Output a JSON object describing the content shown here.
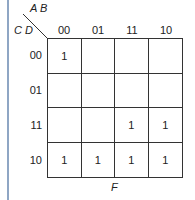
{
  "kmap": {
    "row_var": "C D",
    "col_var": "A B",
    "col_labels": [
      "00",
      "01",
      "11",
      "10"
    ],
    "row_labels": [
      "00",
      "01",
      "11",
      "10"
    ],
    "cells": [
      [
        "1",
        "",
        "",
        ""
      ],
      [
        "",
        "",
        "",
        ""
      ],
      [
        "",
        "",
        "1",
        "1"
      ],
      [
        "1",
        "1",
        "1",
        "1"
      ]
    ],
    "function_label": "F"
  }
}
